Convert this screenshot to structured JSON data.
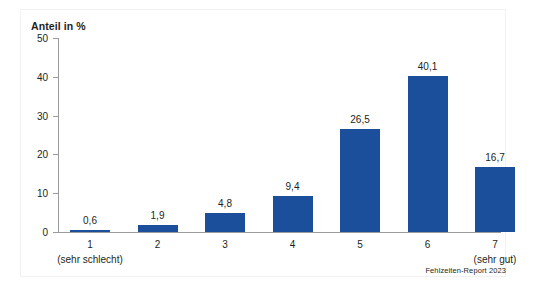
{
  "chart_data": {
    "type": "bar",
    "title": "",
    "ylabel": "Anteil in %",
    "xlabel": "",
    "ylim": [
      0,
      50
    ],
    "yticks": [
      0,
      10,
      20,
      30,
      40,
      50
    ],
    "ytick_labels": [
      "0",
      "10",
      "20",
      "30",
      "40",
      "50"
    ],
    "grid": false,
    "legend": "none",
    "categories": [
      "1",
      "2",
      "3",
      "4",
      "5",
      "6",
      "7"
    ],
    "category_sublabels": [
      "(sehr schlecht)",
      "",
      "",
      "",
      "",
      "",
      "(sehr gut)"
    ],
    "values": [
      0.6,
      1.9,
      4.8,
      9.4,
      26.5,
      40.1,
      16.7
    ],
    "value_labels": [
      "0,6",
      "1,9",
      "4,8",
      "9,4",
      "26,5",
      "40,1",
      "16,7"
    ],
    "bar_color": "#1b4f9c",
    "axis_color": "#9b9b9b",
    "text_color": "#231f20"
  },
  "source": {
    "note": "Fehlzeiten-Report 2023"
  }
}
